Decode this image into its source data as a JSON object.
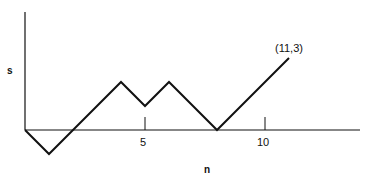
{
  "chart_data": {
    "type": "line",
    "title": "",
    "xlabel": "n",
    "ylabel": "s",
    "x": [
      0,
      1,
      2,
      3,
      4,
      5,
      6,
      7,
      8,
      9,
      10,
      11
    ],
    "series": [
      {
        "name": "random walk",
        "values": [
          0,
          -1,
          0,
          1,
          2,
          1,
          2,
          1,
          0,
          1,
          2,
          3
        ]
      }
    ],
    "xticks": [
      5,
      10
    ],
    "tick_labels": [
      "5",
      "10"
    ],
    "annotations": [
      {
        "text": "(11,3)",
        "x": 11,
        "y": 3
      }
    ],
    "xlim": [
      0,
      14
    ],
    "ylim": [
      -1,
      4.7
    ],
    "grid": false,
    "legend": "none"
  }
}
